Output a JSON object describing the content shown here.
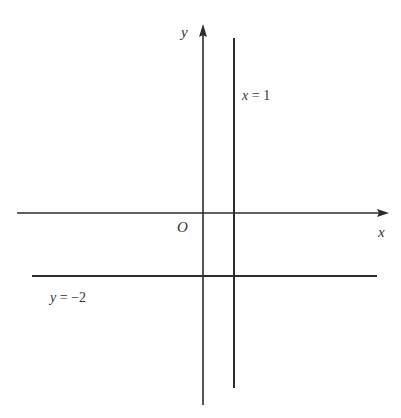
{
  "diagram": {
    "type": "coordinate-plane",
    "colors": {
      "line": "#2b2b2b",
      "text": "#333333",
      "background": "#ffffff"
    },
    "axes": {
      "x": {
        "label": "x"
      },
      "y": {
        "label": "y"
      },
      "origin": {
        "label": "O"
      }
    },
    "lines": [
      {
        "id": "vertical",
        "equation_var": "x",
        "equation_eq": " = ",
        "equation_val": "1",
        "label": "x = 1"
      },
      {
        "id": "horizontal",
        "equation_var": "y",
        "equation_eq": " = ",
        "equation_val": "−2",
        "label": "y = −2"
      }
    ]
  }
}
